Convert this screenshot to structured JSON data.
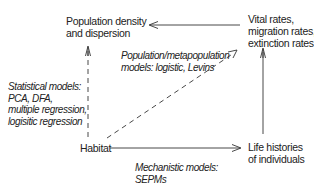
{
  "nodes": {
    "population_density": {
      "lines": [
        "Population density",
        "and dispersion"
      ]
    },
    "vital_rates": {
      "lines": [
        "Vital rates,",
        "migration rates,",
        "extinction rates"
      ]
    },
    "habitat": {
      "lines": [
        "Habitat"
      ]
    },
    "life_histories": {
      "lines": [
        "Life histories",
        "of individuals"
      ]
    }
  },
  "edge_labels": {
    "statistical": {
      "lines": [
        "Statistical models:",
        "PCA, DFA,",
        "multiple regression,",
        "logisitic regression"
      ]
    },
    "population_models": {
      "lines": [
        "Population/metapopulation",
        "models: logistic, Levins"
      ]
    },
    "mechanistic": {
      "lines": [
        "Mechanistic models:",
        "SEPMs"
      ]
    }
  },
  "edges": [
    {
      "from": "vital_rates",
      "to": "population_density",
      "style": "solid"
    },
    {
      "from": "habitat",
      "to": "population_density",
      "style": "dashed",
      "label": "statistical"
    },
    {
      "from": "habitat",
      "to": "vital_rates",
      "style": "dashed",
      "label": "population_models"
    },
    {
      "from": "habitat",
      "to": "life_histories",
      "style": "solid",
      "label": "mechanistic"
    },
    {
      "from": "life_histories",
      "to": "vital_rates",
      "style": "solid"
    }
  ],
  "colors": {
    "stroke": "#333333",
    "text": "#222222",
    "background": "#ffffff"
  }
}
